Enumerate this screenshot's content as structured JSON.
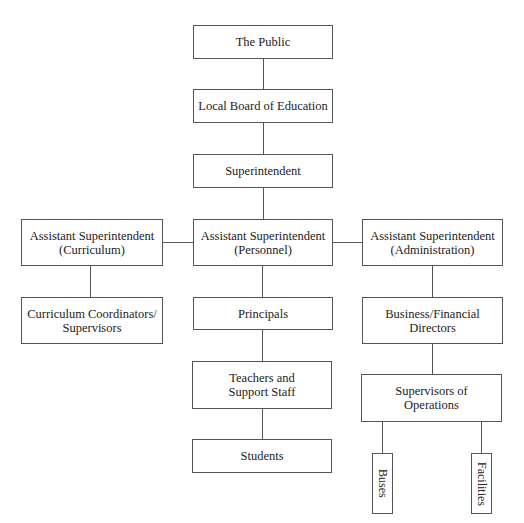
{
  "diagram": {
    "type": "org-chart",
    "nodes": {
      "public": {
        "line1": "The Public"
      },
      "board": {
        "line1": "Local Board of Education"
      },
      "superintendent": {
        "line1": "Superintendent"
      },
      "asst_curriculum": {
        "line1": "Assistant Superintendent",
        "line2": "(Curriculum)"
      },
      "asst_personnel": {
        "line1": "Assistant Superintendent",
        "line2": "(Personnel)"
      },
      "asst_administration": {
        "line1": "Assistant Superintendent",
        "line2": "(Administration)"
      },
      "curriculum_coordinators": {
        "line1": "Curriculum Coordinators/",
        "line2": "Supervisors"
      },
      "principals": {
        "line1": "Principals"
      },
      "business_directors": {
        "line1": "Business/Financial",
        "line2": "Directors"
      },
      "teachers": {
        "line1": "Teachers and",
        "line2": "Support Staff"
      },
      "students": {
        "line1": "Students"
      },
      "supervisors_operations": {
        "line1": "Supervisors of",
        "line2": "Operations"
      },
      "buses": {
        "line1": "Buses"
      },
      "facilities": {
        "line1": "Facilities"
      }
    },
    "edges": [
      [
        "public",
        "board"
      ],
      [
        "board",
        "superintendent"
      ],
      [
        "superintendent",
        "asst_personnel"
      ],
      [
        "asst_personnel",
        "asst_curriculum"
      ],
      [
        "asst_personnel",
        "asst_administration"
      ],
      [
        "asst_curriculum",
        "curriculum_coordinators"
      ],
      [
        "asst_personnel",
        "principals"
      ],
      [
        "asst_administration",
        "business_directors"
      ],
      [
        "principals",
        "teachers"
      ],
      [
        "teachers",
        "students"
      ],
      [
        "business_directors",
        "supervisors_operations"
      ],
      [
        "supervisors_operations",
        "buses"
      ],
      [
        "supervisors_operations",
        "facilities"
      ]
    ]
  }
}
